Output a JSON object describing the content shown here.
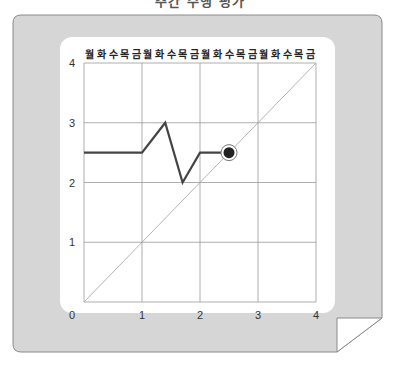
{
  "top_title": "주간 수행 평가",
  "chart_data": {
    "type": "line",
    "title": "",
    "header_labels": [
      "월",
      "화",
      "수",
      "목",
      "금",
      "월",
      "화",
      "수",
      "목",
      "금",
      "월",
      "화",
      "수",
      "목",
      "금",
      "월",
      "화",
      "수",
      "목",
      "금"
    ],
    "xlabel": "",
    "ylabel": "",
    "x_ticks": [
      "0",
      "1",
      "2",
      "3",
      "4"
    ],
    "y_ticks": [
      "1",
      "2",
      "3",
      "4"
    ],
    "xlim": [
      0,
      4
    ],
    "ylim": [
      0,
      4
    ],
    "grid": true,
    "series": [
      {
        "name": "performance",
        "x": [
          0,
          1,
          1.4,
          1.7,
          2,
          2.5
        ],
        "y": [
          2.5,
          2.5,
          3,
          2,
          2.5,
          2.5
        ],
        "color": "#444444"
      },
      {
        "name": "diagonal",
        "x": [
          0,
          4
        ],
        "y": [
          0,
          4
        ],
        "color": "#aaaaaa"
      }
    ],
    "marker": {
      "x": 2.5,
      "y": 2.5,
      "color": "#222222"
    }
  },
  "colors": {
    "panel": "#d9d9d9",
    "card": "#ffffff",
    "grid": "#999999"
  }
}
